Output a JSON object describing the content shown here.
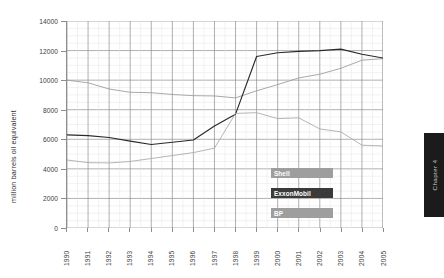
{
  "chart_data": {
    "type": "line",
    "title": "",
    "xlabel": "",
    "ylabel": "million barrels oil equivalent",
    "x": [
      1990,
      1991,
      1992,
      1993,
      1994,
      1995,
      1996,
      1997,
      1998,
      1999,
      2000,
      2001,
      2002,
      2003,
      2004,
      2005
    ],
    "categories": [
      "1990",
      "1991",
      "1992",
      "1993",
      "1994",
      "1995",
      "1996",
      "1997",
      "1998",
      "1999",
      "2000",
      "2001",
      "2002",
      "2003",
      "2004",
      "2005"
    ],
    "ylim": [
      0,
      14000
    ],
    "yticks": [
      0,
      2000,
      4000,
      6000,
      8000,
      10000,
      12000,
      14000
    ],
    "ytick_labels": [
      "0",
      "2000",
      "4000",
      "6000",
      "8000",
      "10000",
      "12000",
      "14000"
    ],
    "grid": true,
    "legend_position": "inside-bottom-center",
    "series": [
      {
        "name": "Shell",
        "color": "#9a9a9a",
        "values": [
          10000,
          9820,
          9400,
          9180,
          9150,
          9030,
          8950,
          8930,
          8800,
          9280,
          9700,
          10150,
          10400,
          10800,
          11350,
          11450
        ]
      },
      {
        "name": "ExxonMobil",
        "color": "#2a2a2a",
        "values": [
          6300,
          6250,
          6120,
          5880,
          5650,
          5800,
          5950,
          6900,
          7700,
          11600,
          11850,
          11950,
          12000,
          12100,
          11750,
          11500
        ]
      },
      {
        "name": "BP",
        "color": "#a8a8a8",
        "values": [
          4600,
          4420,
          4400,
          4500,
          4700,
          4900,
          5100,
          5400,
          7750,
          7800,
          7400,
          7450,
          6700,
          6500,
          5600,
          5550
        ]
      }
    ],
    "annotations": []
  },
  "legend": {
    "items": [
      {
        "label": "Shell",
        "swatch_color": "#9e9e9e"
      },
      {
        "label": "ExxonMobil",
        "swatch_color": "#3a3a3a"
      },
      {
        "label": "BP",
        "swatch_color": "#9e9e9e"
      }
    ]
  },
  "sidebar": {
    "chapter_label": "Chapter 4"
  },
  "colors": {
    "grid_minor": "#e3e3e3",
    "grid_major": "#8d8d8d",
    "axis": "#8d8d8d",
    "tick_text": "#3b3b3b",
    "chapter_tab_bg": "#1b1b1b",
    "chapter_tab_text": "#c8c8c8"
  }
}
